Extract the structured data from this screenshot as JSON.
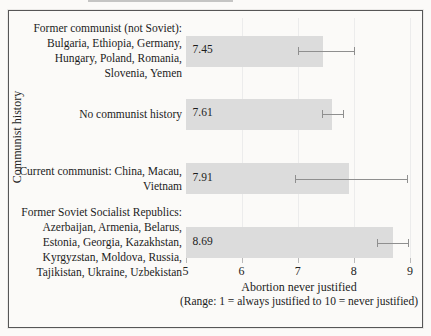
{
  "figure": {
    "background": "#fbfaf8",
    "frame_border_color": "#565656"
  },
  "chart_data": {
    "type": "bar",
    "orientation": "horizontal",
    "title": "",
    "xlabel": "Abortion never justified",
    "xlabel_sub": "(Range: 1 = always justified to 10 = never justified)",
    "ylabel": "Communist history",
    "xlim": [
      5,
      9
    ],
    "xticks": [
      5,
      6,
      7,
      8,
      9
    ],
    "grid": true,
    "legend": "none",
    "bar_color": "#dcdcdc",
    "error_bar_color": "#8f8f8f",
    "gridline_color": "#ececec",
    "categories": [
      {
        "label": "Former communist (not Soviet): Bulgaria, Ethiopia, Germany, Hungary, Poland, Romania, Slovenia, Yemen",
        "lines": [
          "Former communist (not Soviet):",
          "Bulgaria, Ethiopia, Germany,",
          "Hungary, Poland, Romania,",
          "Slovenia, Yemen"
        ]
      },
      {
        "label": "No communist history",
        "lines": [
          "No communist history"
        ]
      },
      {
        "label": "Current communist: China, Macau, Vietnam",
        "lines": [
          "Current communist: China, Macau,",
          "Vietnam"
        ]
      },
      {
        "label": "Former Soviet Socialist Republics: Azerbaijan, Armenia, Belarus, Estonia, Georgia, Kazakhstan, Kyrgyzstan, Moldova, Russia, Tajikistan, Ukraine, Uzbekistan",
        "lines": [
          "Former Soviet Socialist Republics:",
          "Azerbaijan, Armenia, Belarus,",
          "Estonia, Georgia, Kazakhstan,",
          "Kyrgyzstan, Moldova, Russia,",
          "Tajikistan, Ukraine, Uzbekistan"
        ]
      }
    ],
    "values": [
      7.45,
      7.61,
      7.91,
      8.69
    ],
    "value_labels": [
      "7.45",
      "7.61",
      "7.91",
      "8.69"
    ],
    "error_low": [
      7.0,
      7.43,
      6.95,
      8.42
    ],
    "error_high": [
      8.02,
      7.83,
      8.96,
      8.98
    ]
  }
}
